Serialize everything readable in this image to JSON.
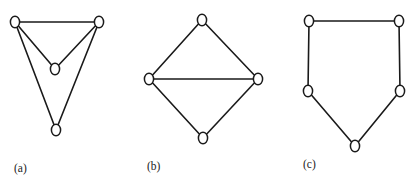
{
  "figure": {
    "background_color": "#ffffff",
    "edge_color": "#1a1a1a",
    "vertex_fill_color": "#ffffff",
    "vertex_stroke_color": "#1a1a1a",
    "caption_color": "#222222",
    "width": 417,
    "height": 185
  },
  "panels": [
    {
      "id": "a",
      "caption": "(a)",
      "caption_x": 14,
      "caption_y": 169,
      "vertex_rx": 4.6,
      "vertex_ry": 5.8,
      "vertices": [
        {
          "name": "a-top-left",
          "x": 15,
          "y": 22
        },
        {
          "name": "a-top-right",
          "x": 99,
          "y": 22
        },
        {
          "name": "a-middle",
          "x": 55,
          "y": 69
        },
        {
          "name": "a-bottom",
          "x": 56,
          "y": 130
        }
      ],
      "edges": [
        {
          "from": 0,
          "to": 1
        },
        {
          "from": 0,
          "to": 2
        },
        {
          "from": 1,
          "to": 2
        },
        {
          "from": 0,
          "to": 3
        },
        {
          "from": 1,
          "to": 3
        }
      ],
      "vertex_count": 4,
      "edge_count": 5
    },
    {
      "id": "b",
      "caption": "(b)",
      "caption_x": 147,
      "caption_y": 167,
      "vertex_rx": 4.6,
      "vertex_ry": 5.8,
      "vertices": [
        {
          "name": "b-top",
          "x": 202,
          "y": 20
        },
        {
          "name": "b-left",
          "x": 149,
          "y": 79
        },
        {
          "name": "b-right",
          "x": 258,
          "y": 79
        },
        {
          "name": "b-bottom",
          "x": 203,
          "y": 138
        }
      ],
      "edges": [
        {
          "from": 0,
          "to": 1
        },
        {
          "from": 0,
          "to": 2
        },
        {
          "from": 1,
          "to": 2
        },
        {
          "from": 1,
          "to": 3
        },
        {
          "from": 2,
          "to": 3
        }
      ],
      "vertex_count": 4,
      "edge_count": 5
    },
    {
      "id": "c",
      "caption": "(c)",
      "caption_x": 303,
      "caption_y": 165,
      "vertex_rx": 4.6,
      "vertex_ry": 5.8,
      "vertices": [
        {
          "name": "c-top-left",
          "x": 309,
          "y": 21
        },
        {
          "name": "c-top-right",
          "x": 399,
          "y": 21
        },
        {
          "name": "c-middle-left",
          "x": 308,
          "y": 91
        },
        {
          "name": "c-middle-right",
          "x": 400,
          "y": 91
        },
        {
          "name": "c-bottom",
          "x": 355,
          "y": 146
        }
      ],
      "edges": [
        {
          "from": 0,
          "to": 1
        },
        {
          "from": 0,
          "to": 2
        },
        {
          "from": 1,
          "to": 3
        },
        {
          "from": 2,
          "to": 4
        },
        {
          "from": 3,
          "to": 4
        }
      ],
      "vertex_count": 5,
      "edge_count": 5
    }
  ]
}
